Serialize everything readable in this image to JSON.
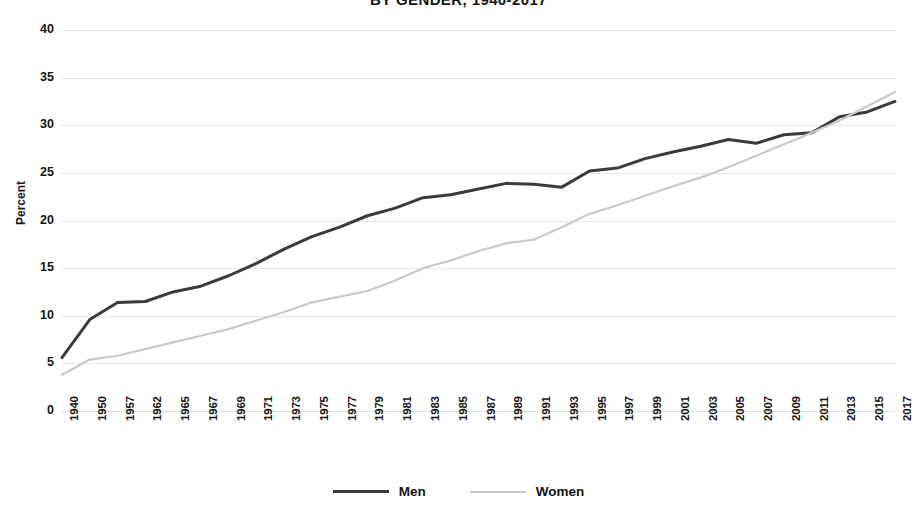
{
  "chart_data": {
    "type": "line",
    "title": "BY GENDER, 1940-2017",
    "xlabel": "",
    "ylabel": "Percent",
    "ylim": [
      0,
      40
    ],
    "ytick_step": 5,
    "yticks": [
      "0",
      "5",
      "10",
      "15",
      "20",
      "25",
      "30",
      "35",
      "40"
    ],
    "grid": true,
    "legend_position": "bottom",
    "categories": [
      "1940",
      "1950",
      "1957",
      "1962",
      "1965",
      "1967",
      "1969",
      "1971",
      "1973",
      "1975",
      "1977",
      "1979",
      "1981",
      "1983",
      "1985",
      "1987",
      "1989",
      "1991",
      "1993",
      "1995",
      "1997",
      "1999",
      "2001",
      "2003",
      "2005",
      "2007",
      "2009",
      "2011",
      "2013",
      "2015",
      "2017"
    ],
    "series": [
      {
        "name": "Men",
        "color": "#3a3a3a",
        "values": [
          5.6,
          9.6,
          11.4,
          11.5,
          12.5,
          13.1,
          14.2,
          15.5,
          17.0,
          18.3,
          19.3,
          20.5,
          21.3,
          22.4,
          22.7,
          23.3,
          23.9,
          23.8,
          23.5,
          25.2,
          25.5,
          26.5,
          27.2,
          27.8,
          28.5,
          28.1,
          29.0,
          29.2,
          30.9,
          31.4,
          32.5
        ]
      },
      {
        "name": "Women",
        "color": "#c9c9c9",
        "values": [
          3.8,
          5.4,
          5.8,
          6.5,
          7.2,
          7.9,
          8.6,
          9.5,
          10.4,
          11.4,
          12.0,
          12.6,
          13.7,
          15.0,
          15.8,
          16.8,
          17.6,
          18.0,
          19.3,
          20.7,
          21.6,
          22.6,
          23.6,
          24.5,
          25.6,
          26.8,
          28.0,
          29.2,
          30.5,
          32.0,
          33.5
        ]
      }
    ]
  },
  "legend": {
    "items": [
      {
        "label": "Men",
        "color": "#3a3a3a"
      },
      {
        "label": "Women",
        "color": "#c9c9c9"
      }
    ]
  }
}
